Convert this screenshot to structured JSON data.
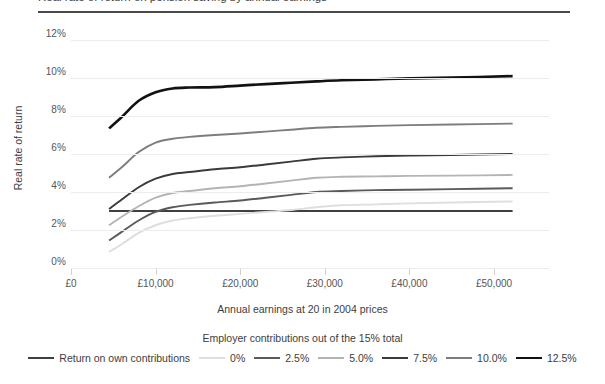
{
  "title_partial": "Figure: Real rate of return on pension saving by annual earnings",
  "axes": {
    "y_title": "Real rate of return",
    "x_title": "Annual earnings at 20 in 2004 prices",
    "y_ticks": [
      "0%",
      "2%",
      "4%",
      "6%",
      "8%",
      "10%",
      "12%"
    ],
    "x_ticks": [
      "£0",
      "£10,000",
      "£20,000",
      "£30,000",
      "£40,000",
      "£50,000"
    ]
  },
  "legend": {
    "title": "Employer contributions out of the 15% total",
    "items": [
      {
        "label": "Return on own contributions",
        "color": "#3f3f3f",
        "width": 1.9
      },
      {
        "label": "0%",
        "color": "#dedede",
        "width": 1.9
      },
      {
        "label": "2.5%",
        "color": "#5a5a5a",
        "width": 1.9
      },
      {
        "label": "5.0%",
        "color": "#b4b4b4",
        "width": 1.9
      },
      {
        "label": "7.5%",
        "color": "#3a3a3a",
        "width": 1.9
      },
      {
        "label": "10.0%",
        "color": "#7d7d7d",
        "width": 1.9
      },
      {
        "label": "12.5%",
        "color": "#121212",
        "width": 2.6
      }
    ]
  },
  "chart_data": {
    "type": "line",
    "title": "Real rate of return on pension saving by annual earnings",
    "xlabel": "Annual earnings at 20 in 2004 prices",
    "ylabel": "Real rate of return",
    "xlim": [
      0,
      56500
    ],
    "ylim": [
      0,
      12
    ],
    "x_tick_values": [
      0,
      10000,
      20000,
      30000,
      40000,
      50000
    ],
    "y_tick_values": [
      0,
      2,
      4,
      6,
      8,
      10,
      12
    ],
    "grid": "horizontal",
    "legend_position": "bottom",
    "x": [
      4500,
      6000,
      8000,
      10000,
      12000,
      14000,
      17000,
      20000,
      23000,
      26000,
      29000,
      32000,
      36000,
      40000,
      45000,
      52200
    ],
    "series": [
      {
        "name": "Return on own contributions",
        "color": "#3f3f3f",
        "values": [
          3.0,
          3.0,
          3.0,
          3.0,
          3.0,
          3.0,
          3.0,
          3.0,
          3.0,
          3.0,
          3.0,
          3.0,
          3.0,
          3.0,
          3.0,
          3.0
        ]
      },
      {
        "name": "0%",
        "color": "#dedede",
        "values": [
          0.85,
          1.25,
          1.85,
          2.25,
          2.5,
          2.62,
          2.75,
          2.85,
          2.95,
          3.05,
          3.2,
          3.3,
          3.35,
          3.4,
          3.45,
          3.5
        ]
      },
      {
        "name": "2.5%",
        "color": "#5a5a5a",
        "values": [
          1.45,
          1.9,
          2.5,
          2.95,
          3.2,
          3.32,
          3.45,
          3.55,
          3.7,
          3.85,
          4.0,
          4.05,
          4.1,
          4.12,
          4.15,
          4.2
        ]
      },
      {
        "name": "5.0%",
        "color": "#b4b4b4",
        "values": [
          2.25,
          2.7,
          3.25,
          3.7,
          3.95,
          4.05,
          4.2,
          4.3,
          4.45,
          4.6,
          4.75,
          4.8,
          4.82,
          4.85,
          4.86,
          4.9
        ]
      },
      {
        "name": "7.5%",
        "color": "#3a3a3a",
        "values": [
          3.1,
          3.6,
          4.25,
          4.7,
          4.95,
          5.05,
          5.2,
          5.3,
          5.45,
          5.6,
          5.75,
          5.82,
          5.88,
          5.92,
          5.95,
          6.0
        ]
      },
      {
        "name": "10.0%",
        "color": "#7d7d7d",
        "values": [
          4.75,
          5.3,
          6.1,
          6.6,
          6.8,
          6.9,
          7.0,
          7.08,
          7.18,
          7.28,
          7.38,
          7.43,
          7.48,
          7.52,
          7.55,
          7.6
        ]
      },
      {
        "name": "12.5%",
        "color": "#121212",
        "values": [
          7.35,
          7.95,
          8.8,
          9.25,
          9.45,
          9.5,
          9.52,
          9.6,
          9.68,
          9.75,
          9.82,
          9.88,
          9.93,
          9.98,
          10.02,
          10.1
        ]
      }
    ]
  }
}
